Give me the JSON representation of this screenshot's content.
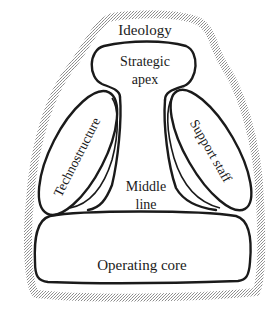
{
  "diagram": {
    "outer_label": "Ideology",
    "parts": {
      "strategic_apex": {
        "line1": "Strategic",
        "line2": "apex"
      },
      "technostructure": {
        "label": "Technostructure"
      },
      "support_staff": {
        "label": "Support staff"
      },
      "middle_line": {
        "line1": "Middle",
        "line2": "line"
      },
      "operating_core": {
        "label": "Operating core"
      }
    },
    "colors": {
      "stroke": "#1a1a1a",
      "halo": "#b8b8b8",
      "background": "#ffffff"
    }
  }
}
